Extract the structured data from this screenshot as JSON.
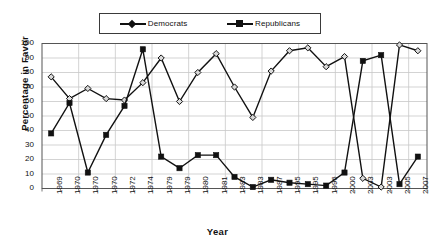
{
  "chart_data": {
    "type": "line",
    "title": "",
    "xlabel": "Year",
    "ylabel": "Percentage in Favor",
    "ylim": [
      0,
      100
    ],
    "ytick_step": 10,
    "yticks": [
      0,
      10,
      20,
      30,
      40,
      50,
      60,
      70,
      80,
      90,
      100
    ],
    "grid": true,
    "legend_position": "top-center",
    "categories": [
      "1969",
      "1970",
      "1970",
      "1970",
      "1972",
      "1974",
      "1979",
      "1979",
      "1980",
      "1981",
      "1983",
      "1983",
      "1987",
      "1995",
      "1995",
      "1996",
      "2000",
      "2003",
      "2003",
      "2005",
      "2007"
    ],
    "series": [
      {
        "name": "Democrats",
        "marker": "diamond",
        "color": "#111111",
        "values": [
          77,
          62,
          69,
          62,
          61,
          73,
          90,
          60,
          80,
          93,
          70,
          49,
          81,
          95,
          97,
          84,
          91,
          7,
          1,
          99,
          95
        ]
      },
      {
        "name": "Republicans",
        "marker": "square",
        "color": "#111111",
        "values": [
          38,
          59,
          11,
          37,
          57,
          96,
          22,
          14,
          23,
          23,
          8,
          1,
          6,
          4,
          3,
          2,
          11,
          88,
          92,
          3,
          22
        ]
      }
    ]
  },
  "legend": {
    "items": [
      {
        "label": "Democrats",
        "marker": "diamond"
      },
      {
        "label": "Republicans",
        "marker": "square"
      }
    ]
  },
  "axes": {
    "y_title": "Percentage in Favor",
    "x_title": "Year"
  }
}
